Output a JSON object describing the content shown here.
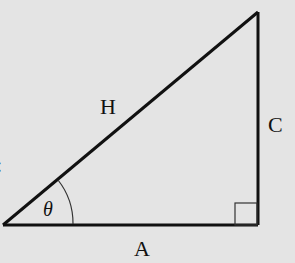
{
  "diagram": {
    "type": "right-triangle",
    "labels": {
      "hypotenuse": "H",
      "opposite": "C",
      "adjacent": "A",
      "angle": "θ"
    },
    "edge_fragment": ":",
    "colors": {
      "background": "#e4e4e4",
      "stroke": "#111111"
    }
  }
}
